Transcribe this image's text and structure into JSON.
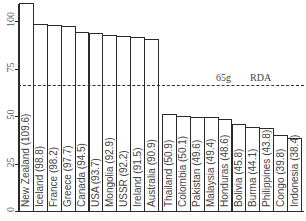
{
  "chart_data": {
    "type": "bar",
    "title": "",
    "xlabel": "",
    "ylabel": "",
    "ylim": [
      0,
      112
    ],
    "yticks": [
      0,
      25,
      50,
      75,
      100
    ],
    "grid": false,
    "categories": [
      "New Zealand",
      "Iceland",
      "France",
      "Greece",
      "Canada",
      "USA",
      "Mongolia",
      "USSR",
      "Ireland",
      "Australia",
      "Thailand",
      "Colombia",
      "Pakistan",
      "Malaysia",
      "Honduras",
      "Bolivia",
      "Burma",
      "Philippines",
      "Congo",
      "Indonesia"
    ],
    "values": [
      109.6,
      98.8,
      98.2,
      97.7,
      94.5,
      93.7,
      92.9,
      92.2,
      91.5,
      90.9,
      50.9,
      50.1,
      49.6,
      49.4,
      48.6,
      45.8,
      44.1,
      43.8,
      39.8,
      38.4
    ],
    "labels": [
      "New Zealand (109.6)",
      "Iceland (98.8)",
      "France (98.2)",
      "Greece (97.7)",
      "Canada (94.5)",
      "USA (93.7)",
      "Mongolia (92.9)",
      "USSR (92.2)",
      "Ireland (91.5)",
      "Australia (90.9)",
      "Thailand (50.9)",
      "Colombia (50.1)",
      "Pakistan (49.6)",
      "Malaysia (49.4)",
      "Honduras (48.6)",
      "Bolivia (45.8)",
      "Burma (44.1)",
      "Philippines (43.8)",
      "Congo (39.8)",
      "Indonesia (38.4)"
    ],
    "annotations": [
      {
        "type": "hline",
        "y": 65,
        "style": "dashed",
        "text_value": "65g",
        "text_label": "RDA"
      }
    ]
  },
  "reference_line": {
    "value_label": "65g",
    "name_label": "RDA",
    "value": 65
  },
  "axis": {
    "tick_labels": [
      "0",
      "25",
      "50",
      "75",
      "100"
    ]
  }
}
